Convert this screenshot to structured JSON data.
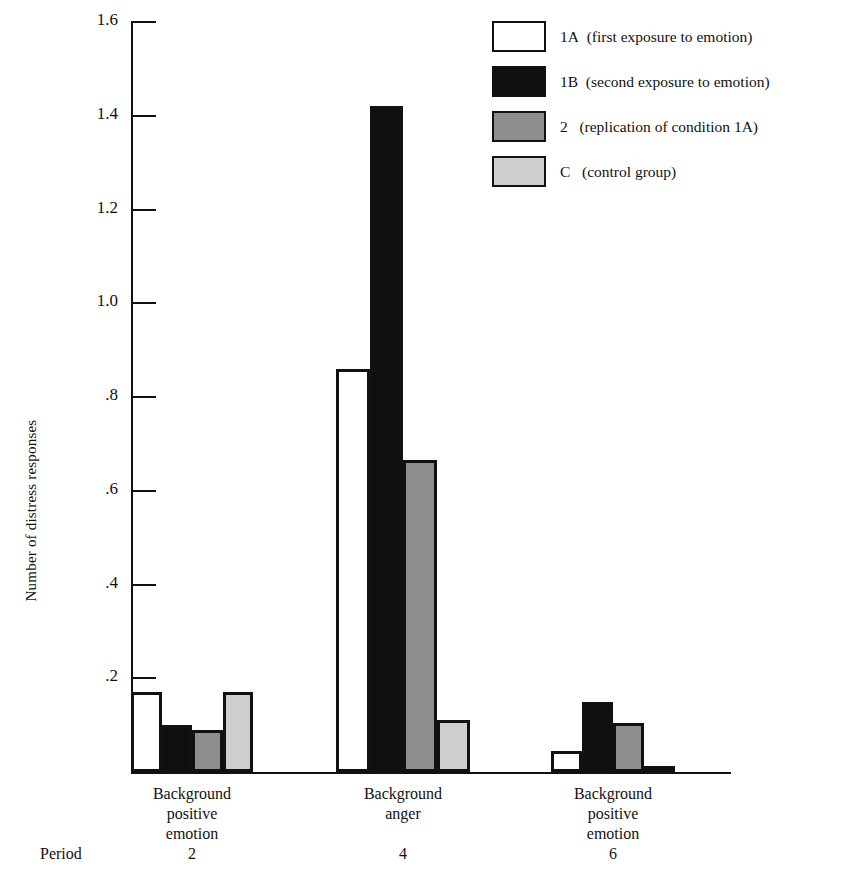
{
  "chart_data": {
    "type": "bar",
    "title": "",
    "xlabel": "",
    "ylabel": "Number of distress responses",
    "ylim": [
      0,
      1.6
    ],
    "ytick_labels": [
      "1.6",
      "1.4",
      "1.2",
      "1.0",
      ".8",
      ".6",
      ".4",
      ".2"
    ],
    "ytick_values": [
      1.6,
      1.4,
      1.2,
      1.0,
      0.8,
      0.6,
      0.4,
      0.2
    ],
    "grid": false,
    "legend_position": "top-right",
    "categories": [
      "Background positive emotion",
      "Background anger",
      "Background positive emotion"
    ],
    "category_lines": [
      [
        "Background",
        "positive",
        "emotion"
      ],
      [
        "Background",
        "anger"
      ],
      [
        "Background",
        "positive",
        "emotion"
      ]
    ],
    "period_label": "Period",
    "periods": [
      "2",
      "4",
      "6"
    ],
    "series": [
      {
        "name": "1A",
        "description": "(first exposure to emotion)",
        "color": "#ffffff",
        "values": [
          0.17,
          0.86,
          0.045
        ]
      },
      {
        "name": "1B",
        "description": "(second exposure to emotion)",
        "color": "#100f0d",
        "values": [
          0.1,
          1.42,
          0.15
        ]
      },
      {
        "name": "2",
        "description": "(replication of condition 1A)",
        "color": "#8e8e8e",
        "values": [
          0.09,
          0.665,
          0.105
        ]
      },
      {
        "name": "C",
        "description": "(control group)",
        "color": "#cfcfcf",
        "values": [
          0.17,
          0.11,
          0.012
        ]
      }
    ]
  },
  "legend": {
    "items": [
      {
        "label": "1A",
        "desc": "(first exposure to emotion)",
        "swatch": "white-swatch"
      },
      {
        "label": "1B",
        "desc": "(second exposure to emotion)",
        "swatch": "black-swatch"
      },
      {
        "label": "2",
        "desc": "(replication of condition 1A)",
        "swatch": "gray-swatch"
      },
      {
        "label": "C",
        "desc": "(control group)",
        "swatch": "light-gray-swatch"
      }
    ]
  }
}
